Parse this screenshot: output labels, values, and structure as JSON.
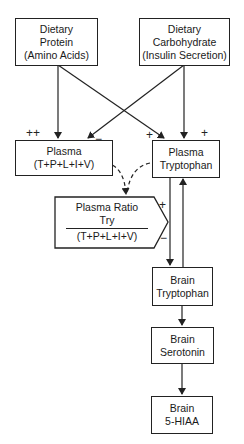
{
  "diagram": {
    "nodes": {
      "dietary_protein": {
        "line1": "Dietary",
        "line2": "Protein",
        "line3": "(Amino Acids)"
      },
      "dietary_carbohydrate": {
        "line1": "Dietary",
        "line2": "Carbohydrate",
        "line3": "(Insulin Secretion)"
      },
      "plasma_lnaa": {
        "line1": "Plasma",
        "line2": "(T+P+L+I+V)"
      },
      "plasma_tryptophan": {
        "line1": "Plasma",
        "line2": "Tryptophan"
      },
      "plasma_ratio": {
        "title": "Plasma Ratio",
        "numerator": "Try",
        "denominator": "(T+P+L+I+V)"
      },
      "brain_tryptophan": {
        "line1": "Brain",
        "line2": "Tryptophan"
      },
      "brain_serotonin": {
        "line1": "Brain",
        "line2": "Serotonin"
      },
      "brain_5hiaa": {
        "line1": "Brain",
        "line2": "5-HIAA"
      }
    },
    "signs": {
      "protein_to_plasma": "++",
      "carb_to_plasma": "−",
      "protein_to_plasma_trp": "+",
      "carb_to_plasma_trp": "+",
      "ratio_plus": "+",
      "ratio_minus": "−"
    },
    "edges": [
      {
        "from": "dietary_protein",
        "to": "plasma_lnaa",
        "style": "solid"
      },
      {
        "from": "dietary_protein",
        "to": "plasma_tryptophan",
        "style": "solid"
      },
      {
        "from": "dietary_carbohydrate",
        "to": "plasma_lnaa",
        "style": "solid"
      },
      {
        "from": "dietary_carbohydrate",
        "to": "plasma_tryptophan",
        "style": "solid"
      },
      {
        "from": "plasma_lnaa",
        "to": "plasma_ratio",
        "style": "dashed"
      },
      {
        "from": "plasma_tryptophan",
        "to": "plasma_ratio",
        "style": "dashed"
      },
      {
        "from": "plasma_tryptophan",
        "to": "brain_tryptophan",
        "style": "solid"
      },
      {
        "from": "brain_tryptophan",
        "to": "plasma_tryptophan",
        "style": "solid"
      },
      {
        "from": "brain_tryptophan",
        "to": "brain_serotonin",
        "style": "solid"
      },
      {
        "from": "brain_serotonin",
        "to": "brain_5hiaa",
        "style": "solid"
      }
    ]
  }
}
